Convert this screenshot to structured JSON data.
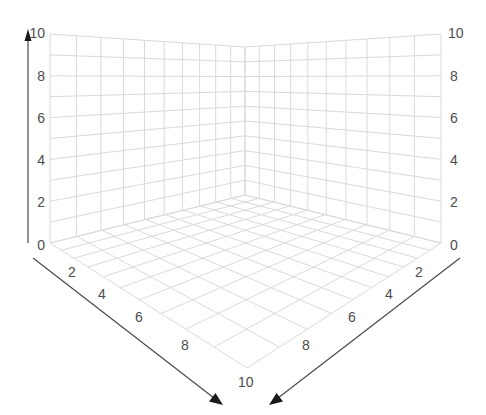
{
  "chart_data": {
    "type": "3d-axes-grid",
    "title": "",
    "axes": {
      "z": {
        "label": "",
        "range": [
          0,
          10
        ],
        "ticks": [
          0,
          2,
          4,
          6,
          8,
          10
        ],
        "position": "vertical, left and right edges"
      },
      "x": {
        "label": "",
        "range": [
          0,
          10
        ],
        "ticks": [
          2,
          4,
          6,
          8,
          10
        ],
        "position": "front-left floor edge"
      },
      "y": {
        "label": "",
        "range": [
          0,
          10
        ],
        "ticks": [
          2,
          4,
          6,
          8
        ],
        "position": "front-right floor edge"
      }
    },
    "grid": true,
    "grid_divisions": 10,
    "series": []
  },
  "colors": {
    "grid": "#dadada",
    "axis": "#4a4a4a",
    "text": "#4d4d4d",
    "background": "#ffffff"
  },
  "labels": {
    "z_left": [
      "0",
      "2",
      "4",
      "6",
      "8",
      "10"
    ],
    "z_right": [
      "0",
      "2",
      "4",
      "6",
      "8",
      "10"
    ],
    "x_front_left": [
      "2",
      "4",
      "6",
      "8",
      "10"
    ],
    "y_front_right": [
      "2",
      "4",
      "6",
      "8"
    ]
  }
}
